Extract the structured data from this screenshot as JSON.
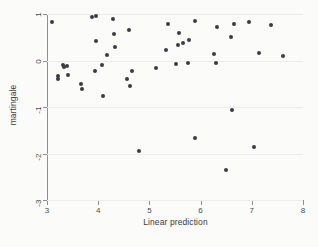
{
  "chart_data": {
    "type": "scatter",
    "title": "",
    "xlabel": "Linear prediction",
    "ylabel": "martingale",
    "xlim": [
      3,
      8
    ],
    "ylim": [
      -3,
      1
    ],
    "xticks": [
      3,
      4,
      5,
      6,
      7,
      8
    ],
    "yticks": [
      1,
      0,
      -1,
      -2,
      -3
    ],
    "xticklabels": [
      "3",
      "4",
      "5",
      "6",
      "7",
      "8"
    ],
    "yticklabels": [
      "1",
      "0",
      "-1",
      "-2",
      "-3"
    ],
    "grid": "horizontal",
    "legend": "none",
    "marker": "filled-circle",
    "marker_color": "#3c3c42",
    "background_color": "#fbfbfa",
    "axis_color": "#8f8f92",
    "gridline_color": "#ebebe9",
    "n_points": 48,
    "points": [
      {
        "x": 3.1,
        "y": 0.83
      },
      {
        "x": 3.22,
        "y": -0.34
      },
      {
        "x": 3.22,
        "y": -0.4
      },
      {
        "x": 3.32,
        "y": -0.09
      },
      {
        "x": 3.33,
        "y": -0.13
      },
      {
        "x": 3.4,
        "y": -0.11
      },
      {
        "x": 3.41,
        "y": -0.32
      },
      {
        "x": 3.66,
        "y": -0.5
      },
      {
        "x": 3.68,
        "y": -0.61
      },
      {
        "x": 3.88,
        "y": 0.93
      },
      {
        "x": 3.96,
        "y": 0.95
      },
      {
        "x": 3.95,
        "y": 0.41
      },
      {
        "x": 3.93,
        "y": -0.23
      },
      {
        "x": 4.08,
        "y": -0.09
      },
      {
        "x": 4.1,
        "y": -0.77
      },
      {
        "x": 4.17,
        "y": 0.12
      },
      {
        "x": 4.29,
        "y": 0.9
      },
      {
        "x": 4.31,
        "y": 0.57
      },
      {
        "x": 4.33,
        "y": 0.3
      },
      {
        "x": 4.56,
        "y": -0.39
      },
      {
        "x": 4.6,
        "y": 0.66
      },
      {
        "x": 4.62,
        "y": -0.55
      },
      {
        "x": 4.66,
        "y": -0.23
      },
      {
        "x": 4.79,
        "y": -1.95
      },
      {
        "x": 5.12,
        "y": -0.16
      },
      {
        "x": 5.33,
        "y": 0.22
      },
      {
        "x": 5.36,
        "y": 0.78
      },
      {
        "x": 5.52,
        "y": -0.07
      },
      {
        "x": 5.55,
        "y": 0.33
      },
      {
        "x": 5.58,
        "y": 0.6
      },
      {
        "x": 5.66,
        "y": 0.38
      },
      {
        "x": 5.76,
        "y": -0.06
      },
      {
        "x": 5.78,
        "y": 0.44
      },
      {
        "x": 5.89,
        "y": 0.86
      },
      {
        "x": 5.9,
        "y": -1.66
      },
      {
        "x": 6.27,
        "y": 0.15
      },
      {
        "x": 6.3,
        "y": -0.06
      },
      {
        "x": 6.33,
        "y": 0.72
      },
      {
        "x": 6.5,
        "y": -2.36
      },
      {
        "x": 6.6,
        "y": 0.5
      },
      {
        "x": 6.62,
        "y": -1.07
      },
      {
        "x": 6.65,
        "y": 0.79
      },
      {
        "x": 6.95,
        "y": 0.82
      },
      {
        "x": 7.05,
        "y": -1.86
      },
      {
        "x": 7.15,
        "y": 0.16
      },
      {
        "x": 7.38,
        "y": 0.77
      },
      {
        "x": 7.6,
        "y": 0.1
      }
    ]
  }
}
